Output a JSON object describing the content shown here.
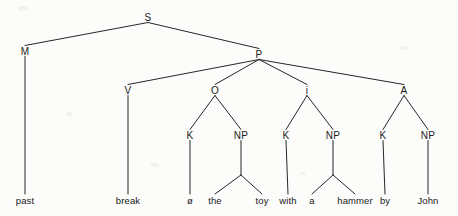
{
  "figure": {
    "kind": "syntax-tree",
    "title": "",
    "background_color": "#fcfcfb",
    "line_color": "#262626",
    "text_color": "#1a1a1a",
    "width": 458,
    "height": 216
  },
  "nodes": [
    {
      "id": "S",
      "label": "S",
      "x": 148,
      "y": 17,
      "level": 0
    },
    {
      "id": "M",
      "label": "M",
      "x": 25,
      "y": 51,
      "level": 1
    },
    {
      "id": "P",
      "label": "P",
      "x": 259,
      "y": 54,
      "level": 1
    },
    {
      "id": "V",
      "label": "V",
      "x": 128,
      "y": 90,
      "level": 2
    },
    {
      "id": "O",
      "label": "O",
      "x": 215,
      "y": 90,
      "level": 2
    },
    {
      "id": "i",
      "label": "i",
      "x": 307,
      "y": 90,
      "level": 2
    },
    {
      "id": "A",
      "label": "A",
      "x": 404,
      "y": 90,
      "level": 2
    },
    {
      "id": "K1",
      "label": "K",
      "x": 190,
      "y": 135,
      "level": 3
    },
    {
      "id": "NP1",
      "label": "NP",
      "x": 241,
      "y": 135,
      "level": 3
    },
    {
      "id": "K2",
      "label": "K",
      "x": 286,
      "y": 135,
      "level": 3
    },
    {
      "id": "NP2",
      "label": "NP",
      "x": 333,
      "y": 135,
      "level": 3
    },
    {
      "id": "K3",
      "label": "K",
      "x": 383,
      "y": 135,
      "level": 3
    },
    {
      "id": "NP3",
      "label": "NP",
      "x": 428,
      "y": 135,
      "level": 3
    }
  ],
  "leaves": [
    {
      "id": "L_past",
      "label": "past",
      "x": 25,
      "y": 200,
      "parent": "M"
    },
    {
      "id": "L_break",
      "label": "break",
      "x": 128,
      "y": 200,
      "parent": "V"
    },
    {
      "id": "L_zero",
      "label": "ø",
      "x": 190,
      "y": 200,
      "parent": "K1"
    },
    {
      "id": "L_the",
      "label": "the",
      "x": 215,
      "y": 200,
      "parent": "NP1"
    },
    {
      "id": "L_toy",
      "label": "toy",
      "x": 262,
      "y": 200,
      "parent": "NP1"
    },
    {
      "id": "L_with",
      "label": "with",
      "x": 288,
      "y": 200,
      "parent": "K2"
    },
    {
      "id": "L_a",
      "label": "a",
      "x": 312,
      "y": 200,
      "parent": "NP2"
    },
    {
      "id": "L_hammer",
      "label": "hammer",
      "x": 355,
      "y": 200,
      "parent": "NP2"
    },
    {
      "id": "L_by",
      "label": "by",
      "x": 385,
      "y": 200,
      "parent": "K3"
    },
    {
      "id": "L_John",
      "label": "John",
      "x": 428,
      "y": 200,
      "parent": "NP3"
    }
  ],
  "edges": [
    {
      "from": "S",
      "to": "M"
    },
    {
      "from": "S",
      "to": "P"
    },
    {
      "from": "P",
      "to": "V"
    },
    {
      "from": "P",
      "to": "O"
    },
    {
      "from": "P",
      "to": "i"
    },
    {
      "from": "P",
      "to": "A"
    },
    {
      "from": "M",
      "to": "L_past"
    },
    {
      "from": "V",
      "to": "L_break"
    },
    {
      "from": "O",
      "to": "K1"
    },
    {
      "from": "O",
      "to": "NP1"
    },
    {
      "from": "K1",
      "to": "L_zero"
    },
    {
      "from": "NP1",
      "to": "L_the"
    },
    {
      "from": "NP1",
      "to": "L_toy"
    },
    {
      "from": "i",
      "to": "K2"
    },
    {
      "from": "i",
      "to": "NP2"
    },
    {
      "from": "K2",
      "to": "L_with"
    },
    {
      "from": "NP2",
      "to": "L_a"
    },
    {
      "from": "NP2",
      "to": "L_hammer"
    },
    {
      "from": "A",
      "to": "K3"
    },
    {
      "from": "A",
      "to": "NP3"
    },
    {
      "from": "K3",
      "to": "L_by"
    },
    {
      "from": "NP3",
      "to": "L_John"
    }
  ],
  "sentence": {
    "words": [
      "past",
      "break",
      "ø",
      "the",
      "toy",
      "with",
      "a",
      "hammer",
      "by",
      "John"
    ],
    "text": "past break ø the toy with a hammer by John"
  }
}
